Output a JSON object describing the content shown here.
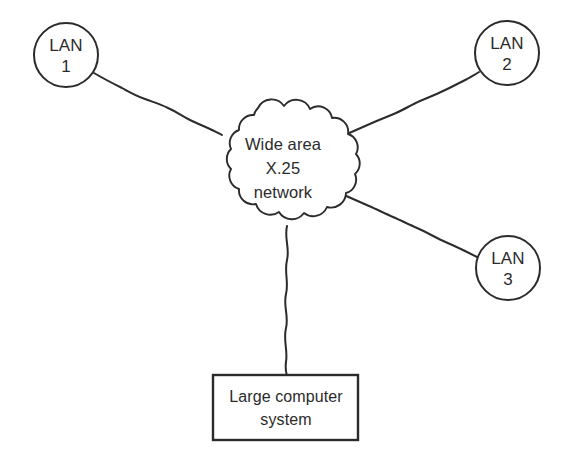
{
  "diagram": {
    "background_color": "#ffffff",
    "stroke_color": "#2b2b2b",
    "nodes": {
      "lan1": {
        "name": "LAN 1",
        "line1": "LAN",
        "line2": "1",
        "shape": "circle",
        "cx": 66,
        "cy": 55,
        "r": 32
      },
      "lan2": {
        "name": "LAN 2",
        "line1": "LAN",
        "line2": "2",
        "shape": "circle",
        "cx": 507,
        "cy": 53,
        "r": 32
      },
      "lan3": {
        "name": "LAN 3",
        "line1": "LAN",
        "line2": "3",
        "shape": "circle",
        "cx": 508,
        "cy": 268,
        "r": 32
      },
      "cloud": {
        "name": "Wide area X.25 network",
        "line1": "Wide area",
        "line2": "X.25",
        "line3": "network",
        "shape": "cloud",
        "cx": 283,
        "cy": 166
      },
      "host": {
        "name": "Large computer system",
        "line1": "Large computer",
        "line2": "system",
        "shape": "rectangle",
        "x": 213,
        "y": 375,
        "width": 145,
        "height": 65
      }
    },
    "links": [
      {
        "id": "link-lan1-cloud",
        "from": "lan1",
        "to": "cloud"
      },
      {
        "id": "link-lan2-cloud",
        "from": "lan2",
        "to": "cloud"
      },
      {
        "id": "link-lan3-cloud",
        "from": "lan3",
        "to": "cloud"
      },
      {
        "id": "link-host-cloud",
        "from": "host",
        "to": "cloud"
      }
    ]
  }
}
